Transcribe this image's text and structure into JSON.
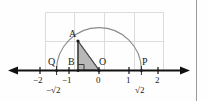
{
  "figure": {
    "type": "geometry-number-line-semicircle",
    "colors": {
      "axis": "#111111",
      "curve": "#808080",
      "grid": "#d8d8d8",
      "shade_fill": "#b3b3b3",
      "triangle_stroke": "#4d4d4d",
      "border": "#9a9a9a",
      "text": "#1b1b1b"
    },
    "axis": {
      "left_arrow": true,
      "right_arrow": true,
      "ticks": [
        {
          "label": "−2",
          "value": -2
        },
        {
          "label": "−1",
          "value": -1
        },
        {
          "label": "0",
          "value": 0
        },
        {
          "label": "1",
          "value": 1
        },
        {
          "label": "2",
          "value": 2
        }
      ],
      "irrational_ticks": [
        {
          "label": "−√2",
          "value": -1.414
        },
        {
          "label": "√2",
          "value": 1.414
        }
      ]
    },
    "points": [
      {
        "name": "A",
        "label": "A",
        "x": -1,
        "y": 1
      },
      {
        "name": "B",
        "label": "B",
        "x": -1,
        "y": 0
      },
      {
        "name": "O",
        "label": "O",
        "x": 0,
        "y": 0
      },
      {
        "name": "Q",
        "label": "Q",
        "x": -1.414,
        "y": 0
      },
      {
        "name": "P",
        "label": "P",
        "x": 1.414,
        "y": 0
      }
    ],
    "semicircle": {
      "center_x": 0,
      "center_y": 0,
      "radius": 1.414
    },
    "triangle": {
      "vertices": [
        "A",
        "B",
        "O"
      ],
      "shaded": true,
      "right_angle_at": "B"
    },
    "grid": {
      "visible": true,
      "columns": 4,
      "rows": 2
    }
  }
}
